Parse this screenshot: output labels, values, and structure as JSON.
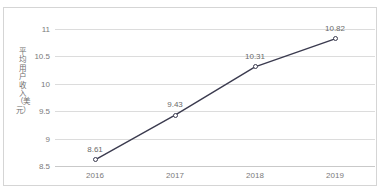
{
  "figure": {
    "background_color": "#ffffff",
    "border_color": "#d5d5d5",
    "top_clipped_text": ""
  },
  "chart_data": {
    "type": "line",
    "title": "",
    "xlabel": "",
    "ylabel": "平均用户收入（美元）",
    "categories": [
      "2016",
      "2017",
      "2018",
      "2019"
    ],
    "values": [
      8.61,
      9.43,
      10.31,
      10.82
    ],
    "data_labels": [
      "8.61",
      "9.43",
      "10.31",
      "10.82"
    ],
    "ylim": [
      8.5,
      11
    ],
    "yticks": [
      8.5,
      9,
      9.5,
      10,
      10.5,
      11
    ],
    "ytick_labels": [
      "8.5",
      "9",
      "9.5",
      "10",
      "10.5",
      "11"
    ],
    "grid": true,
    "grid_axis": "y",
    "legend": false,
    "legend_position": "none",
    "series": [
      {
        "name": "平均用户收入（美元）",
        "values": [
          8.61,
          9.43,
          10.31,
          10.82
        ],
        "line_color": "#3b3b4f",
        "marker": "open-circle",
        "marker_face_color": "#ffffff"
      }
    ],
    "colors": {
      "line": "#3b3b4f",
      "grid": "#dcdcdc",
      "axis": "#c9c9c9",
      "tick_text": "#7a7a7a",
      "label_text": "#6a6a6a"
    }
  }
}
